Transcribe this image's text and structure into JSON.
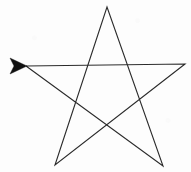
{
  "figure": {
    "name": "pentagram-star",
    "background_color": "#fdfdfd",
    "stroke_color": "#2b2b2b",
    "stroke_width": 1.1,
    "arrow_color": "#111111",
    "width": 191,
    "height": 172
  },
  "chart_data": {
    "type": "line",
    "title": "",
    "xlabel": "",
    "ylabel": "",
    "xlim": [
      0,
      191
    ],
    "ylim": [
      0,
      172
    ],
    "grid": false,
    "legend": "none",
    "vertices": [
      {
        "name": "left-point",
        "x": 26,
        "y": 66,
        "order": 1
      },
      {
        "name": "right-point",
        "x": 185,
        "y": 64,
        "order": 2
      },
      {
        "name": "bottom-left-point",
        "x": 55,
        "y": 165,
        "order": 3
      },
      {
        "name": "top-point",
        "x": 107,
        "y": 7,
        "order": 4
      },
      {
        "name": "bottom-right-point",
        "x": 163,
        "y": 166,
        "order": 5
      }
    ],
    "path_points": "26,66 185,64 55,165 107,7 163,166 26,66",
    "annotations": [
      {
        "name": "direction-arrowhead",
        "shape": "filled-triangle",
        "points": "27,66 10,58 14,66 10,74",
        "tip_x": 27,
        "tip_y": 66,
        "meaning": "start point and drawing direction"
      }
    ]
  }
}
